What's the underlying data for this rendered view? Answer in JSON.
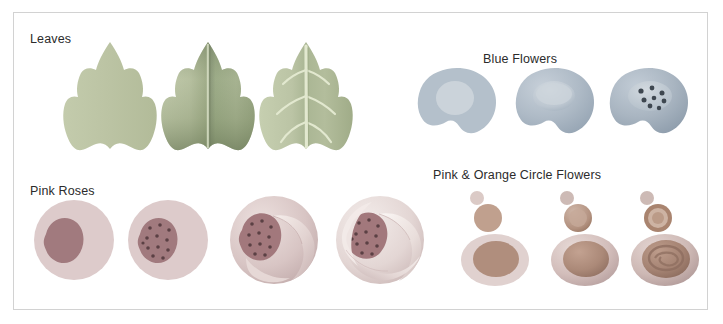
{
  "sheet": {
    "title": "Botanical Shape Construction Reference Sheet",
    "background_color": "#ffffff",
    "frame_border_color": "#d2d2d2",
    "label_color": "#2b2b2b"
  },
  "sections": [
    {
      "id": "leaves",
      "label": "Leaves",
      "label_x": 30,
      "label_y": 32,
      "palette": {
        "base": "#b9c19f",
        "light": "#c7cfb0",
        "mid": "#a9b492",
        "shadow": "#8f9b79",
        "deep_shadow": "#7d8a68",
        "vein": "#dfe6cc",
        "highlight": "#d3daba"
      },
      "stages": [
        {
          "id": "leaf-flat-silhouette",
          "caption": "flat silhouette",
          "x": 60,
          "y": 40,
          "w": 100,
          "h": 112
        },
        {
          "id": "leaf-shaded-midrib",
          "caption": "shaded with midrib",
          "x": 158,
          "y": 40,
          "w": 100,
          "h": 112
        },
        {
          "id": "leaf-veined",
          "caption": "veins added",
          "x": 256,
          "y": 40,
          "w": 100,
          "h": 112
        }
      ]
    },
    {
      "id": "blue-flowers",
      "label": "Blue Flowers",
      "label_x": 483,
      "label_y": 52,
      "palette": {
        "base": "#aebac6",
        "light": "#c3ccd5",
        "mid": "#9faebc",
        "shadow": "#8b9bab",
        "center": "#c9d1d8",
        "center_shadow": "#aab6c1",
        "stamen": "#3e4750"
      },
      "stages": [
        {
          "id": "blue-flat-blob",
          "caption": "flat blob with center circle",
          "x": 415,
          "y": 66,
          "w": 84,
          "h": 70
        },
        {
          "id": "blue-shaded",
          "caption": "shaded dome center",
          "x": 513,
          "y": 66,
          "w": 84,
          "h": 70
        },
        {
          "id": "blue-stamens",
          "caption": "stamen dots added",
          "x": 607,
          "y": 66,
          "w": 84,
          "h": 70
        }
      ]
    },
    {
      "id": "pink-roses",
      "label": "Pink Roses",
      "label_x": 30,
      "label_y": 184,
      "palette": {
        "base": "#dcc9ca",
        "light": "#eadcdc",
        "mid": "#cbb4b6",
        "shadow": "#b59c9f",
        "core": "#a2787c",
        "core_dark": "#8d656a",
        "dot": "#5c4044",
        "petal_light": "#f4ecea",
        "petal_shadow": "#c9b4b4"
      },
      "stages": [
        {
          "id": "rose-circle-core",
          "caption": "circle with teardrop core",
          "x": 32,
          "y": 196,
          "w": 84,
          "h": 88
        },
        {
          "id": "rose-core-dots",
          "caption": "core texture dots",
          "x": 126,
          "y": 196,
          "w": 84,
          "h": 88
        },
        {
          "id": "rose-one-petal",
          "caption": "first wrapping petal",
          "x": 226,
          "y": 192,
          "w": 96,
          "h": 96
        },
        {
          "id": "rose-full-petals",
          "caption": "full spiral petals",
          "x": 332,
          "y": 192,
          "w": 96,
          "h": 96
        }
      ]
    },
    {
      "id": "circle-flowers",
      "label": "Pink & Orange Circle Flowers",
      "label_x": 433,
      "label_y": 168,
      "palette": {
        "pink_light": "#e3d3d2",
        "pink_mid": "#d2bcbc",
        "pink_shadow": "#bda5a6",
        "orange_base": "#c8a896",
        "orange_mid": "#b79382",
        "orange_dark": "#9c7a6b",
        "orange_deep": "#87685c",
        "bud_small": "#d8c6c2",
        "ring": "#b08f80",
        "ring_inner": "#cdb6a8"
      },
      "stages": [
        {
          "id": "circle-flat-stack",
          "caption": "flat circle stack",
          "x": 455,
          "y": 188,
          "w": 82,
          "h": 100
        },
        {
          "id": "circle-shaded-stack",
          "caption": "shaded circle stack",
          "x": 545,
          "y": 188,
          "w": 82,
          "h": 100
        },
        {
          "id": "circle-detailed-stack",
          "caption": "detailed spiral center",
          "x": 625,
          "y": 188,
          "w": 82,
          "h": 100
        }
      ]
    }
  ]
}
